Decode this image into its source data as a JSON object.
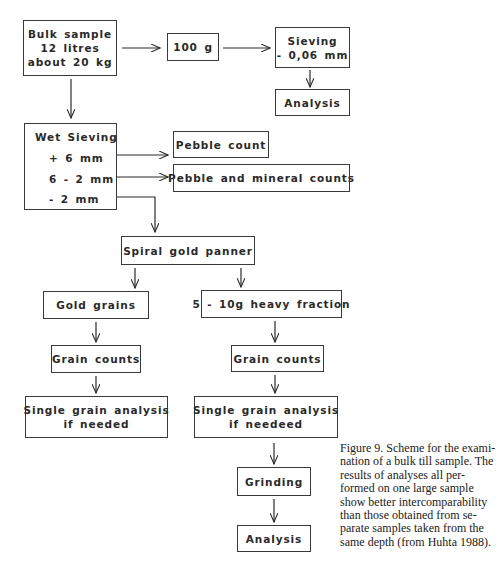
{
  "figure": {
    "caption_lines": [
      "Figure 9. Scheme for the exami-",
      "nation of a bulk till sample. The",
      "results of analyses all per-",
      "formed on one large sample",
      "show better intercomparability",
      "than those obtained from se-",
      "parate samples taken from the",
      "same depth (from Huhta 1988)."
    ]
  },
  "nodes": {
    "bulk_sample": {
      "lines": [
        "Bulk  sample",
        "12  litres",
        "about  20 kg"
      ]
    },
    "hundred_g": {
      "lines": [
        "100 g"
      ]
    },
    "sieving": {
      "lines": [
        "Sieving",
        "- 0,06 mm"
      ]
    },
    "analysis_top": {
      "lines": [
        "Analysis"
      ]
    },
    "wet_sieving": {
      "title": "Wet  Sieving",
      "fractions": [
        "+  6 mm",
        "6 - 2 mm",
        "-   2 mm"
      ]
    },
    "pebble_count": {
      "lines": [
        "Pebble  count"
      ]
    },
    "pebble_mineral": {
      "lines": [
        "Pebble  and  mineral  counts"
      ]
    },
    "spiral_panner": {
      "lines": [
        "Spiral  gold  panner"
      ]
    },
    "gold_grains": {
      "lines": [
        "Gold  grains"
      ]
    },
    "heavy_fraction": {
      "lines": [
        "5 - 10g  heavy  fraction"
      ]
    },
    "grain_counts_left": {
      "lines": [
        "Grain  counts"
      ]
    },
    "grain_counts_right": {
      "lines": [
        "Grain  counts"
      ]
    },
    "single_grain_left": {
      "lines": [
        "Single  grain  analysis",
        "if  needed"
      ]
    },
    "single_grain_right": {
      "lines": [
        "Single  grain  analysis",
        "if  needeed"
      ]
    },
    "grinding": {
      "lines": [
        "Grinding"
      ]
    },
    "analysis_bottom": {
      "lines": [
        "Analysis"
      ]
    }
  },
  "colors": {
    "line": "#2a2a2a",
    "text": "#2a2a2a",
    "background": "#ffffff"
  }
}
